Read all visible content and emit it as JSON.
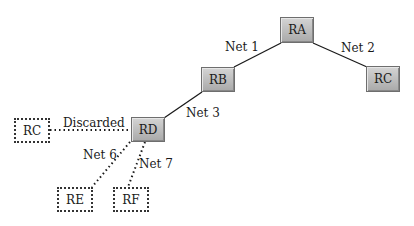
{
  "routers": [
    {
      "id": "ra",
      "label": "RA",
      "style": "solid",
      "x": 280,
      "y": 17,
      "w": 34,
      "h": 26
    },
    {
      "id": "rc-right",
      "label": "RC",
      "style": "solid",
      "x": 366,
      "y": 66,
      "w": 34,
      "h": 26
    },
    {
      "id": "rb",
      "label": "RB",
      "style": "solid",
      "x": 201,
      "y": 67,
      "w": 34,
      "h": 25
    },
    {
      "id": "rd",
      "label": "RD",
      "style": "solid",
      "x": 131,
      "y": 117,
      "w": 34,
      "h": 25
    },
    {
      "id": "rc-left",
      "label": "RC",
      "style": "dashed",
      "x": 14,
      "y": 118,
      "w": 36,
      "h": 25
    },
    {
      "id": "re",
      "label": "RE",
      "style": "dashed",
      "x": 57,
      "y": 187,
      "w": 36,
      "h": 25
    },
    {
      "id": "rf",
      "label": "RF",
      "style": "dashed",
      "x": 113,
      "y": 187,
      "w": 36,
      "h": 25
    }
  ],
  "links": [
    {
      "id": "net1",
      "label": "Net 1",
      "from": "rb",
      "to": "ra",
      "style": "solid",
      "x1": 234,
      "y1": 67,
      "x2": 281,
      "y2": 43,
      "lx": 225,
      "ly": 40
    },
    {
      "id": "net2",
      "label": "Net 2",
      "from": "ra",
      "to": "rc-right",
      "style": "solid",
      "x1": 313,
      "y1": 43,
      "x2": 367,
      "y2": 67,
      "lx": 341,
      "ly": 41
    },
    {
      "id": "net3",
      "label": "Net 3",
      "from": "rd",
      "to": "rb",
      "style": "solid",
      "x1": 164,
      "y1": 118,
      "x2": 202,
      "y2": 92,
      "lx": 186,
      "ly": 106
    },
    {
      "id": "discarded",
      "label": "Discarded",
      "from": "rc-left",
      "to": "rd",
      "style": "dotted",
      "x1": 50,
      "y1": 130,
      "x2": 131,
      "y2": 130,
      "lx": 63,
      "ly": 116
    },
    {
      "id": "net6",
      "label": "Net 6",
      "from": "rd",
      "to": "re",
      "style": "dotted",
      "x1": 130,
      "y1": 142,
      "x2": 92,
      "y2": 187,
      "lx": 83,
      "ly": 148
    },
    {
      "id": "net7",
      "label": "Net 7",
      "from": "rd",
      "to": "rf",
      "style": "dotted",
      "x1": 145,
      "y1": 142,
      "x2": 128,
      "y2": 187,
      "lx": 139,
      "ly": 157
    }
  ],
  "colors": {
    "line": "#1a1a1a",
    "router_fill_top": "#d4d4d4",
    "router_fill_bottom": "#a9a9a9",
    "router_border": "#6e6e6e"
  }
}
